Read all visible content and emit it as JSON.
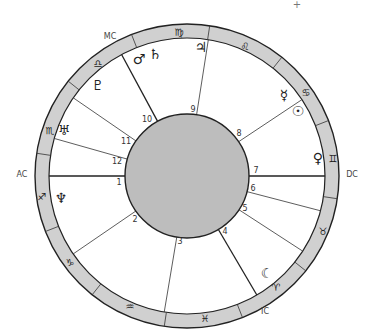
{
  "chart_title": "",
  "geometry": {
    "cx": 187,
    "cy": 176,
    "outer_radius": 152,
    "ring_inner_radius": 138,
    "disk_radius": 62
  },
  "colors": {
    "ring_fill": "#d0d0d0",
    "disk_fill": "#bdbdbd",
    "line": "#222222"
  },
  "angles": [
    {
      "label": "AC",
      "x": 22,
      "y": 174
    },
    {
      "label": "MC",
      "x": 110,
      "y": 36
    },
    {
      "label": "DC",
      "x": 352,
      "y": 174
    },
    {
      "label": "IC",
      "x": 265,
      "y": 311
    }
  ],
  "sign_boundaries_deg": [
    21.4,
    51.4,
    81.4,
    111.4,
    141.4,
    171.4,
    201.4,
    231.4,
    261.4,
    291.4,
    321.4,
    351.4
  ],
  "signs": [
    {
      "name": "Gemini",
      "glyph": "♊",
      "x": 333,
      "y": 158
    },
    {
      "name": "Cancer",
      "glyph": "♋",
      "x": 306,
      "y": 92
    },
    {
      "name": "Leo",
      "glyph": "♌",
      "x": 245,
      "y": 46
    },
    {
      "name": "Virgo",
      "glyph": "♍",
      "x": 179,
      "y": 32
    },
    {
      "name": "Libra",
      "glyph": "♎",
      "x": 98,
      "y": 63
    },
    {
      "name": "Scorpio",
      "glyph": "♏",
      "x": 50,
      "y": 130
    },
    {
      "name": "Sagittarius",
      "glyph": "♐",
      "x": 42,
      "y": 196
    },
    {
      "name": "Capricorn",
      "glyph": "♑",
      "x": 70,
      "y": 262
    },
    {
      "name": "Aquarius",
      "glyph": "♒",
      "x": 130,
      "y": 306
    },
    {
      "name": "Pisces",
      "glyph": "♓",
      "x": 205,
      "y": 318
    },
    {
      "name": "Aries",
      "glyph": "♈",
      "x": 276,
      "y": 287
    },
    {
      "name": "Taurus",
      "glyph": "♉",
      "x": 323,
      "y": 231
    }
  ],
  "houses": [
    {
      "number": "1",
      "cusp_deg": 180.0,
      "label_x": 119,
      "label_y": 182
    },
    {
      "number": "2",
      "cusp_deg": 214.4,
      "label_x": 135,
      "label_y": 219
    },
    {
      "number": "3",
      "cusp_deg": 260.5,
      "label_x": 180,
      "label_y": 241
    },
    {
      "number": "4",
      "cusp_deg": 300.4,
      "label_x": 225,
      "label_y": 231
    },
    {
      "number": "5",
      "cusp_deg": 327.0,
      "label_x": 245,
      "label_y": 208
    },
    {
      "number": "6",
      "cusp_deg": 345.4,
      "label_x": 253,
      "label_y": 188
    },
    {
      "number": "7",
      "cusp_deg": 0.0,
      "label_x": 256,
      "label_y": 170
    },
    {
      "number": "8",
      "cusp_deg": 33.6,
      "label_x": 239,
      "label_y": 133
    },
    {
      "number": "9",
      "cusp_deg": 81.1,
      "label_x": 193,
      "label_y": 109
    },
    {
      "number": "10",
      "cusp_deg": 118.3,
      "label_x": 147,
      "label_y": 119
    },
    {
      "number": "11",
      "cusp_deg": 145.5,
      "label_x": 126,
      "label_y": 141
    },
    {
      "number": "12",
      "cusp_deg": 164.2,
      "label_x": 117,
      "label_y": 161
    }
  ],
  "planets": [
    {
      "name": "Sun",
      "glyph": "☉",
      "x": 298,
      "y": 111
    },
    {
      "name": "Moon",
      "glyph": "☾",
      "x": 267,
      "y": 273
    },
    {
      "name": "Mercury",
      "glyph": "☿",
      "x": 284,
      "y": 95
    },
    {
      "name": "Venus",
      "glyph": "♀",
      "x": 318,
      "y": 158
    },
    {
      "name": "Mars",
      "glyph": "♂",
      "x": 139,
      "y": 59
    },
    {
      "name": "Jupiter",
      "glyph": "♃",
      "x": 201,
      "y": 47
    },
    {
      "name": "Saturn",
      "glyph": "♄",
      "x": 155,
      "y": 54
    },
    {
      "name": "Uranus",
      "glyph": "♅",
      "x": 64,
      "y": 130
    },
    {
      "name": "Neptune",
      "glyph": "♆",
      "x": 61,
      "y": 198
    },
    {
      "name": "Pluto",
      "glyph": "♇",
      "x": 98,
      "y": 85
    }
  ],
  "marker": {
    "glyph": "+",
    "x": 297,
    "y": 4
  }
}
